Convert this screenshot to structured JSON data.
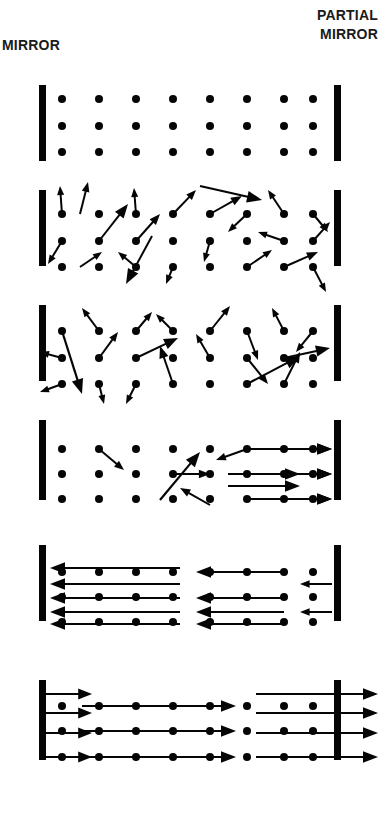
{
  "figure": {
    "background_color": "#ffffff",
    "ink_color": "#050505",
    "width": 384,
    "height": 813
  },
  "labels": {
    "left_mirror": "MIRROR",
    "right_mirror_line1": "PARTIAL",
    "right_mirror_line2": "MIRROR"
  },
  "chart_data": {
    "type": "diagram",
    "panel_count": 6,
    "mirrors": {
      "left": {
        "label": "MIRROR",
        "reflectivity": "full",
        "x": 39,
        "width": 7
      },
      "right": {
        "label": "PARTIAL MIRROR",
        "reflectivity": "partial",
        "x": 334,
        "width": 7
      }
    },
    "atom_grid": {
      "columns": 8,
      "rows": 3,
      "x_start": 62,
      "x_step": 37,
      "dot_radius": 4
    },
    "panels": [
      {
        "index": 1,
        "caption": "Excited atoms at rest, no emission",
        "mirror_top": 85,
        "mirror_bottom": 161,
        "rows_y": [
          99,
          126,
          152
        ],
        "dots": [
          [
            62,
            99
          ],
          [
            99,
            99
          ],
          [
            136,
            99
          ],
          [
            173,
            99
          ],
          [
            210,
            99
          ],
          [
            247,
            99
          ],
          [
            284,
            99
          ],
          [
            313,
            99
          ],
          [
            62,
            126
          ],
          [
            99,
            126
          ],
          [
            136,
            126
          ],
          [
            173,
            126
          ],
          [
            210,
            126
          ],
          [
            247,
            126
          ],
          [
            284,
            126
          ],
          [
            313,
            126
          ],
          [
            62,
            152
          ],
          [
            99,
            152
          ],
          [
            136,
            152
          ],
          [
            173,
            152
          ],
          [
            210,
            152
          ],
          [
            247,
            152
          ],
          [
            284,
            152
          ],
          [
            313,
            152
          ]
        ],
        "rays": []
      },
      {
        "index": 2,
        "caption": "Spontaneous emission in random directions",
        "mirror_top": 190,
        "mirror_bottom": 266,
        "rows_y": [
          214,
          241,
          267
        ],
        "dots": [
          [
            62,
            214
          ],
          [
            99,
            214
          ],
          [
            136,
            214
          ],
          [
            173,
            214
          ],
          [
            210,
            214
          ],
          [
            247,
            214
          ],
          [
            284,
            214
          ],
          [
            313,
            214
          ],
          [
            62,
            241
          ],
          [
            99,
            241
          ],
          [
            136,
            241
          ],
          [
            173,
            241
          ],
          [
            210,
            241
          ],
          [
            247,
            241
          ],
          [
            284,
            241
          ],
          [
            313,
            241
          ],
          [
            62,
            267
          ],
          [
            99,
            267
          ],
          [
            136,
            267
          ],
          [
            173,
            267
          ],
          [
            210,
            267
          ],
          [
            247,
            267
          ],
          [
            284,
            267
          ],
          [
            313,
            267
          ]
        ],
        "rays": [
          [
            62,
            214,
            60,
            186
          ],
          [
            80,
            214,
            88,
            182
          ],
          [
            99,
            241,
            128,
            204
          ],
          [
            136,
            214,
            134,
            188
          ],
          [
            173,
            214,
            196,
            190
          ],
          [
            152,
            236,
            126,
            284
          ],
          [
            62,
            241,
            48,
            264
          ],
          [
            80,
            267,
            102,
            252
          ],
          [
            136,
            241,
            160,
            214
          ],
          [
            136,
            267,
            118,
            252
          ],
          [
            173,
            267,
            166,
            284
          ],
          [
            210,
            241,
            204,
            262
          ],
          [
            210,
            214,
            242,
            196
          ],
          [
            247,
            214,
            228,
            232
          ],
          [
            284,
            214,
            268,
            190
          ],
          [
            284,
            241,
            258,
            232
          ],
          [
            247,
            267,
            272,
            250
          ],
          [
            284,
            267,
            318,
            252
          ],
          [
            313,
            214,
            328,
            232
          ],
          [
            313,
            241,
            330,
            222
          ],
          [
            313,
            267,
            326,
            292
          ],
          [
            200,
            186,
            262,
            200
          ]
        ]
      },
      {
        "index": 3,
        "caption": "Continued random spontaneous emission",
        "mirror_top": 305,
        "mirror_bottom": 381,
        "rows_y": [
          331,
          358,
          384
        ],
        "dots": [
          [
            62,
            331
          ],
          [
            99,
            331
          ],
          [
            136,
            331
          ],
          [
            173,
            331
          ],
          [
            210,
            331
          ],
          [
            247,
            331
          ],
          [
            284,
            331
          ],
          [
            313,
            331
          ],
          [
            62,
            358
          ],
          [
            99,
            358
          ],
          [
            136,
            358
          ],
          [
            173,
            358
          ],
          [
            210,
            358
          ],
          [
            247,
            358
          ],
          [
            284,
            358
          ],
          [
            313,
            358
          ],
          [
            62,
            384
          ],
          [
            99,
            384
          ],
          [
            136,
            384
          ],
          [
            173,
            384
          ],
          [
            210,
            384
          ],
          [
            247,
            384
          ],
          [
            284,
            384
          ],
          [
            313,
            384
          ]
        ],
        "rays": [
          [
            99,
            331,
            82,
            308
          ],
          [
            136,
            331,
            152,
            312
          ],
          [
            99,
            358,
            118,
            332
          ],
          [
            173,
            331,
            156,
            314
          ],
          [
            62,
            331,
            82,
            394
          ],
          [
            62,
            358,
            40,
            352
          ],
          [
            136,
            358,
            178,
            338
          ],
          [
            210,
            331,
            230,
            306
          ],
          [
            62,
            384,
            40,
            392
          ],
          [
            173,
            384,
            160,
            346
          ],
          [
            136,
            384,
            126,
            404
          ],
          [
            247,
            331,
            258,
            360
          ],
          [
            284,
            331,
            272,
            308
          ],
          [
            313,
            331,
            296,
            352
          ],
          [
            247,
            358,
            268,
            384
          ],
          [
            247,
            384,
            300,
            356
          ],
          [
            210,
            358,
            196,
            334
          ],
          [
            284,
            358,
            330,
            348
          ],
          [
            284,
            384,
            300,
            352
          ],
          [
            99,
            384,
            104,
            404
          ]
        ]
      },
      {
        "index": 4,
        "caption": "Stimulated emission begins; axial beams form",
        "mirror_top": 420,
        "mirror_bottom": 500,
        "rows_y": [
          449,
          474,
          499
        ],
        "dots": [
          [
            62,
            449
          ],
          [
            99,
            449
          ],
          [
            136,
            449
          ],
          [
            173,
            449
          ],
          [
            210,
            449
          ],
          [
            247,
            449
          ],
          [
            284,
            449
          ],
          [
            313,
            449
          ],
          [
            62,
            474
          ],
          [
            99,
            474
          ],
          [
            136,
            474
          ],
          [
            173,
            474
          ],
          [
            210,
            474
          ],
          [
            247,
            474
          ],
          [
            284,
            474
          ],
          [
            313,
            474
          ],
          [
            62,
            499
          ],
          [
            99,
            499
          ],
          [
            136,
            499
          ],
          [
            173,
            499
          ],
          [
            210,
            499
          ],
          [
            247,
            499
          ],
          [
            284,
            499
          ],
          [
            313,
            499
          ]
        ],
        "rays": [
          [
            99,
            449,
            124,
            470
          ],
          [
            173,
            474,
            210,
            474
          ],
          [
            160,
            500,
            200,
            452
          ],
          [
            247,
            449,
            216,
            460
          ],
          [
            247,
            449,
            332,
            449
          ],
          [
            284,
            449,
            332,
            449
          ],
          [
            228,
            474,
            300,
            474
          ],
          [
            247,
            474,
            332,
            474
          ],
          [
            228,
            486,
            300,
            486
          ],
          [
            284,
            474,
            332,
            474
          ],
          [
            247,
            499,
            332,
            499
          ],
          [
            284,
            499,
            332,
            499
          ],
          [
            210,
            505,
            180,
            488
          ]
        ]
      },
      {
        "index": 5,
        "caption": "Beams reflect from mirrors; amplification grows",
        "mirror_top": 545,
        "mirror_bottom": 621,
        "rows_y": [
          572,
          597,
          622
        ],
        "dots": [
          [
            62,
            572
          ],
          [
            99,
            572
          ],
          [
            136,
            572
          ],
          [
            173,
            572
          ],
          [
            210,
            572
          ],
          [
            247,
            572
          ],
          [
            284,
            572
          ],
          [
            313,
            572
          ],
          [
            62,
            597
          ],
          [
            99,
            597
          ],
          [
            136,
            597
          ],
          [
            173,
            597
          ],
          [
            210,
            597
          ],
          [
            247,
            597
          ],
          [
            284,
            597
          ],
          [
            313,
            597
          ],
          [
            62,
            622
          ],
          [
            99,
            622
          ],
          [
            136,
            622
          ],
          [
            173,
            622
          ],
          [
            210,
            622
          ],
          [
            247,
            622
          ],
          [
            284,
            622
          ],
          [
            313,
            622
          ]
        ],
        "rays": [
          [
            180,
            568,
            50,
            568
          ],
          [
            180,
            584,
            50,
            584
          ],
          [
            180,
            598,
            50,
            598
          ],
          [
            180,
            612,
            50,
            612
          ],
          [
            180,
            624,
            50,
            624
          ],
          [
            284,
            572,
            196,
            572
          ],
          [
            284,
            598,
            196,
            598
          ],
          [
            284,
            612,
            196,
            612
          ],
          [
            284,
            624,
            196,
            624
          ],
          [
            332,
            584,
            300,
            584
          ],
          [
            332,
            612,
            300,
            612
          ]
        ]
      },
      {
        "index": 6,
        "caption": "Coherent laser beam exits through partial mirror",
        "mirror_top": 680,
        "mirror_bottom": 760,
        "rows_y": [
          706,
          731,
          757
        ],
        "dots": [
          [
            62,
            706
          ],
          [
            99,
            706
          ],
          [
            136,
            706
          ],
          [
            173,
            706
          ],
          [
            210,
            706
          ],
          [
            247,
            706
          ],
          [
            284,
            706
          ],
          [
            313,
            706
          ],
          [
            62,
            731
          ],
          [
            99,
            731
          ],
          [
            136,
            731
          ],
          [
            173,
            731
          ],
          [
            210,
            731
          ],
          [
            247,
            731
          ],
          [
            284,
            731
          ],
          [
            313,
            731
          ],
          [
            62,
            757
          ],
          [
            99,
            757
          ],
          [
            136,
            757
          ],
          [
            173,
            757
          ],
          [
            210,
            757
          ],
          [
            247,
            757
          ],
          [
            284,
            757
          ],
          [
            313,
            757
          ]
        ],
        "rays": [
          [
            46,
            694,
            92,
            694
          ],
          [
            46,
            713,
            92,
            713
          ],
          [
            46,
            733,
            92,
            733
          ],
          [
            46,
            757,
            92,
            757
          ],
          [
            82,
            706,
            236,
            706
          ],
          [
            82,
            731,
            236,
            731
          ],
          [
            82,
            757,
            236,
            757
          ],
          [
            256,
            694,
            378,
            694
          ],
          [
            256,
            713,
            378,
            713
          ],
          [
            256,
            733,
            378,
            733
          ],
          [
            256,
            757,
            378,
            757
          ]
        ]
      }
    ]
  }
}
